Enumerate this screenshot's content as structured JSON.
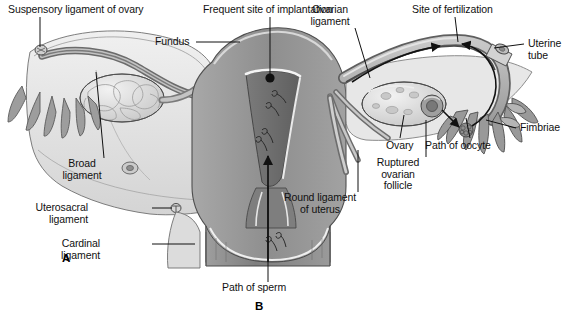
{
  "figure": {
    "background_color": "#ffffff",
    "line_color": "#111111",
    "panel_letters": [
      {
        "name": "panel-a",
        "text": "A",
        "x": 62,
        "y": 252
      },
      {
        "name": "panel-b",
        "text": "B",
        "x": 255,
        "y": 300
      }
    ]
  },
  "labels": [
    {
      "name": "suspensory-ligament-of-ovary",
      "text": "Suspensory ligament of ovary",
      "x": 8,
      "y": 4,
      "align": "l",
      "leader": [
        [
          40,
          17
        ],
        [
          40,
          47
        ]
      ],
      "leader_style": "line"
    },
    {
      "name": "frequent-site-of-implantation",
      "text": "Frequent site of implantation",
      "x": 203,
      "y": 4,
      "align": "l",
      "leader": [
        [
          270,
          17
        ],
        [
          270,
          74
        ]
      ],
      "leader_style": "dot"
    },
    {
      "name": "ovarian-ligament",
      "text": "Ovarian\nligament",
      "x": 330,
      "y": 4,
      "align": "c",
      "leader": [
        [
          355,
          28
        ],
        [
          370,
          78
        ]
      ],
      "leader_style": "line"
    },
    {
      "name": "site-of-fertilization",
      "text": "Site of fertilization",
      "x": 412,
      "y": 4,
      "align": "l",
      "leader": [
        [
          455,
          17
        ],
        [
          458,
          42
        ]
      ],
      "leader_style": "line"
    },
    {
      "name": "fundus",
      "text": "Fundus",
      "x": 155,
      "y": 36,
      "align": "l",
      "leader": [
        [
          196,
          42
        ],
        [
          240,
          42
        ]
      ],
      "leader_style": "line"
    },
    {
      "name": "uterine-tube",
      "text": "Uterine\ntube",
      "x": 528,
      "y": 38,
      "align": "l",
      "leader": [
        [
          524,
          44
        ],
        [
          494,
          48
        ]
      ],
      "leader_style": "line"
    },
    {
      "name": "fimbriae",
      "text": "Fimbriae",
      "x": 520,
      "y": 122,
      "align": "l",
      "leader": [
        [
          516,
          128
        ],
        [
          486,
          120
        ]
      ],
      "leader_style": "line"
    },
    {
      "name": "path-of-oocyte",
      "text": "Path of oocyte",
      "x": 425,
      "y": 140,
      "align": "l",
      "leader": [
        [
          470,
          138
        ],
        [
          466,
          118
        ]
      ],
      "leader_style": "line"
    },
    {
      "name": "ovary",
      "text": "Ovary",
      "x": 386,
      "y": 140,
      "align": "l",
      "leader": [
        [
          400,
          138
        ],
        [
          404,
          115
        ]
      ],
      "leader_style": "line"
    },
    {
      "name": "ruptured-ovarian-follicle",
      "text": "Ruptured\novarian\nfollicle",
      "x": 398,
      "y": 157,
      "align": "c",
      "leader": [
        [
          426,
          157
        ],
        [
          426,
          120
        ]
      ],
      "leader_style": "line"
    },
    {
      "name": "round-ligament-of-uterus",
      "text": "Round ligament\nof uterus",
      "x": 320,
      "y": 192,
      "align": "c",
      "leader": [
        [
          358,
          192
        ],
        [
          358,
          150
        ]
      ],
      "leader_style": "line"
    },
    {
      "name": "broad-ligament",
      "text": "Broad\nligament",
      "x": 82,
      "y": 158,
      "align": "c",
      "leader": [
        [
          104,
          158
        ],
        [
          96,
          72
        ]
      ],
      "leader_style": "line"
    },
    {
      "name": "uterosacral-ligament",
      "text": "Uterosacral\nligament",
      "x": 88,
      "y": 202,
      "align": "r",
      "leader": [
        [
          152,
          208
        ],
        [
          172,
          208
        ]
      ],
      "leader_style": "line"
    },
    {
      "name": "cardinal-ligament",
      "text": "Cardinal\nligament",
      "x": 100,
      "y": 238,
      "align": "r",
      "leader": [
        [
          152,
          244
        ],
        [
          195,
          244
        ]
      ],
      "leader_style": "line"
    },
    {
      "name": "path-of-sperm",
      "text": "Path of sperm",
      "x": 222,
      "y": 282,
      "align": "l",
      "leader": [
        [
          268,
          282
        ],
        [
          268,
          186
        ]
      ],
      "leader_style": "line"
    }
  ],
  "anatomy": {
    "colors": {
      "outline": "#4a4a4a",
      "serosa_light": "#e2e2e2",
      "broad_ligament": "#d8d8d8",
      "myometrium": "#9a9a9a",
      "endometrial_cavity": "#6f6f6f",
      "cavity_line": "#f2f2f2",
      "tube_wall": "#b4b4b4",
      "tube_lumen": "#6a6a6a",
      "ovary_fill": "#e8e8e8",
      "ovary_shade": "#c6c6c6",
      "fimbriae": "#8f8f8f",
      "vagina": "#8a8a8a",
      "cervix": "#7a7a7a",
      "arrow": "#111111"
    },
    "features": [
      {
        "name": "left-ovary",
        "note": "lobulated ovary, left side"
      },
      {
        "name": "right-ovary",
        "note": "ovary with ruptured follicle"
      },
      {
        "name": "uterine-cavity",
        "note": "triangular endometrial cavity"
      },
      {
        "name": "cervix",
        "note": "cervical canal below uterine body"
      },
      {
        "name": "vagina",
        "note": "vaginal canal with sperm"
      },
      {
        "name": "oocyte",
        "note": "released oocyte cluster"
      },
      {
        "name": "sperm-marks",
        "note": "sperm drawn in cavity and vagina"
      }
    ]
  }
}
